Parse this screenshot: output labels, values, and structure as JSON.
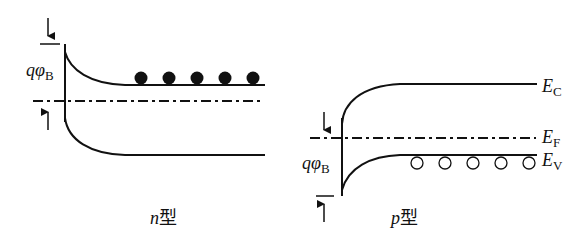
{
  "diagram": {
    "type": "semiconductor-surface-band-bending",
    "panels": [
      {
        "id": "n-type",
        "caption_var": "n",
        "caption_suffix": "型",
        "barrier_label": {
          "q": "q",
          "phi": "φ",
          "sub": "B"
        },
        "carriers": "electrons",
        "carrier_count": 5
      },
      {
        "id": "p-type",
        "caption_var": "p",
        "caption_suffix": "型",
        "barrier_label": {
          "q": "q",
          "phi": "φ",
          "sub": "B"
        },
        "carriers": "holes",
        "carrier_count": 5,
        "band_labels": {
          "ec": {
            "main": "E",
            "sub": "C"
          },
          "ef": {
            "main": "E",
            "sub": "F"
          },
          "ev": {
            "main": "E",
            "sub": "V"
          }
        }
      }
    ],
    "colors": {
      "line": "#111111",
      "background": "#ffffff"
    }
  }
}
